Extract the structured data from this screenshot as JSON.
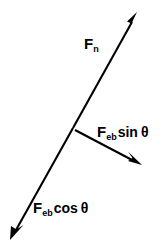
{
  "figure": {
    "type": "vector-force-diagram",
    "background_color": "#ffffff",
    "stroke_color": "#000000",
    "width": 164,
    "height": 250,
    "labels": {
      "normal_force": {
        "symbol": "F",
        "subscript": "n",
        "full_text": "F n"
      },
      "sin_component": {
        "symbol": "F",
        "subscript": "eb",
        "trig": "sin",
        "angle": "θ",
        "full_text": "F eb sin θ"
      },
      "cos_component": {
        "symbol": "F",
        "subscript": "eb",
        "trig": "cos",
        "angle": "θ",
        "full_text": "F eb cos θ"
      }
    },
    "vectors": [
      {
        "name": "normal-force-vector",
        "label_ref": "normal_force",
        "from": [
          73,
          128
        ],
        "to": [
          137,
          13
        ],
        "arrowhead": "end"
      },
      {
        "name": "cos-component-vector",
        "label_ref": "cos_component",
        "from": [
          73,
          128
        ],
        "to": [
          11,
          239
        ],
        "arrowhead": "end"
      },
      {
        "name": "sin-component-vector",
        "label_ref": "sin_component",
        "from": [
          75,
          130
        ],
        "to": [
          141,
          164
        ],
        "arrowhead": "end"
      }
    ]
  }
}
